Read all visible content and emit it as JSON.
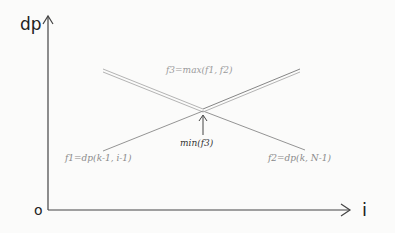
{
  "diagram": {
    "axes": {
      "y_label": "dp",
      "x_label": "i",
      "origin_label": "o"
    },
    "lines": [
      {
        "name": "f1",
        "label": "f1=dp(k-1, i-1)",
        "direction": "increasing"
      },
      {
        "name": "f2",
        "label": "f2=dp(k, N-1)",
        "direction": "decreasing"
      },
      {
        "name": "f3",
        "label": "f3=max(f1, f2)",
        "style": "double-line upper envelope"
      }
    ],
    "annotation": {
      "label": "min(f3)",
      "points_to": "intersection of f1 and f2"
    },
    "colors": {
      "axis": "#444444",
      "line": "#7a7a7a",
      "faint_text": "#9a9a9a",
      "text": "#333333"
    }
  }
}
